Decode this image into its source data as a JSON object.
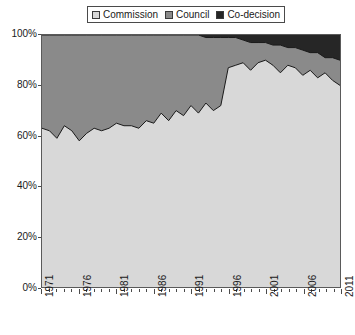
{
  "legend": {
    "position": "top-center",
    "entries": [
      {
        "label": "Commission",
        "color": "#d8d8d8",
        "icon": "legend-swatch-icon"
      },
      {
        "label": "Council",
        "color": "#8a8a8a",
        "icon": "legend-swatch-icon"
      },
      {
        "label": "Co-decision",
        "color": "#262626",
        "icon": "legend-swatch-icon"
      }
    ]
  },
  "axes": {
    "y_ticks": [
      "0%",
      "20%",
      "40%",
      "60%",
      "80%",
      "100%"
    ],
    "x_ticks": [
      "1971",
      "1976",
      "1981",
      "1986",
      "1991",
      "1996",
      "2001",
      "2006",
      "2011"
    ]
  },
  "chart_data": {
    "type": "area",
    "stacked": true,
    "normalized": true,
    "title": "",
    "subtitle": "",
    "xlabel": "",
    "ylabel": "",
    "xlim": [
      1971,
      2011
    ],
    "ylim": [
      0,
      100
    ],
    "grid": false,
    "legend_position": "top-center",
    "ytick_labels": [
      "0%",
      "20%",
      "40%",
      "60%",
      "80%",
      "100%"
    ],
    "ytick_values": [
      0,
      20,
      40,
      60,
      80,
      100
    ],
    "xtick_labels": [
      "1971",
      "1976",
      "1981",
      "1986",
      "1991",
      "1996",
      "2001",
      "2006",
      "2011"
    ],
    "xtick_values": [
      1971,
      1976,
      1981,
      1986,
      1991,
      1996,
      2001,
      2006,
      2011
    ],
    "x": [
      1971,
      1972,
      1973,
      1974,
      1975,
      1976,
      1977,
      1978,
      1979,
      1980,
      1981,
      1982,
      1983,
      1984,
      1985,
      1986,
      1987,
      1988,
      1989,
      1990,
      1991,
      1992,
      1993,
      1994,
      1995,
      1996,
      1997,
      1998,
      1999,
      2000,
      2001,
      2002,
      2003,
      2004,
      2005,
      2006,
      2007,
      2008,
      2009,
      2010,
      2011
    ],
    "series": [
      {
        "name": "Commission",
        "color": "#d8d8d8",
        "values": [
          63,
          62,
          59,
          64,
          62,
          58,
          61,
          63,
          62,
          63,
          65,
          64,
          64,
          63,
          66,
          65,
          69,
          66,
          70,
          68,
          72,
          69,
          73,
          70,
          72,
          87,
          88,
          89,
          86,
          89,
          90,
          88,
          85,
          88,
          87,
          84,
          86,
          83,
          85,
          82,
          80
        ]
      },
      {
        "name": "Council",
        "color": "#8a8a8a",
        "values": [
          37,
          38,
          41,
          36,
          38,
          42,
          39,
          37,
          38,
          37,
          35,
          36,
          36,
          37,
          34,
          35,
          31,
          34,
          30,
          32,
          28,
          31,
          26,
          29,
          27,
          12,
          11,
          9,
          11,
          8,
          7,
          8,
          11,
          7,
          8,
          10,
          7,
          10,
          6,
          9,
          10
        ]
      },
      {
        "name": "Co-decision",
        "color": "#262626",
        "values": [
          0,
          0,
          0,
          0,
          0,
          0,
          0,
          0,
          0,
          0,
          0,
          0,
          0,
          0,
          0,
          0,
          0,
          0,
          0,
          0,
          0,
          0,
          1,
          1,
          1,
          1,
          1,
          2,
          3,
          3,
          3,
          4,
          4,
          5,
          5,
          6,
          7,
          7,
          9,
          9,
          10
        ]
      }
    ]
  }
}
